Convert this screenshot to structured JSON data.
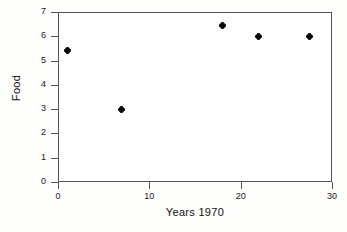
{
  "chart_data": {
    "type": "scatter",
    "title": "",
    "xlabel": "Years 1970",
    "ylabel": "Food",
    "xlim": [
      0,
      30
    ],
    "ylim": [
      0,
      7
    ],
    "xticks": [
      0,
      10,
      20,
      30
    ],
    "yticks": [
      0,
      1,
      2,
      3,
      4,
      5,
      6,
      7
    ],
    "xtick_labels": [
      "0",
      "10",
      "20",
      "30"
    ],
    "ytick_labels": [
      "0",
      "1",
      "2",
      "3",
      "4",
      "5",
      "6",
      "7"
    ],
    "grid": false,
    "legend": "none",
    "marker": "dot",
    "marker_color": "#0a0a0a",
    "series": [
      {
        "name": "Food",
        "points": [
          {
            "x": 1,
            "y": 5.4
          },
          {
            "x": 7,
            "y": 3.0
          },
          {
            "x": 18,
            "y": 6.45
          },
          {
            "x": 22,
            "y": 6.0
          },
          {
            "x": 27.5,
            "y": 6.0
          }
        ]
      }
    ]
  },
  "axes": {
    "frame_color": "#555555",
    "plot_background": "#ffffff",
    "page_background": "#fdfdfc"
  }
}
